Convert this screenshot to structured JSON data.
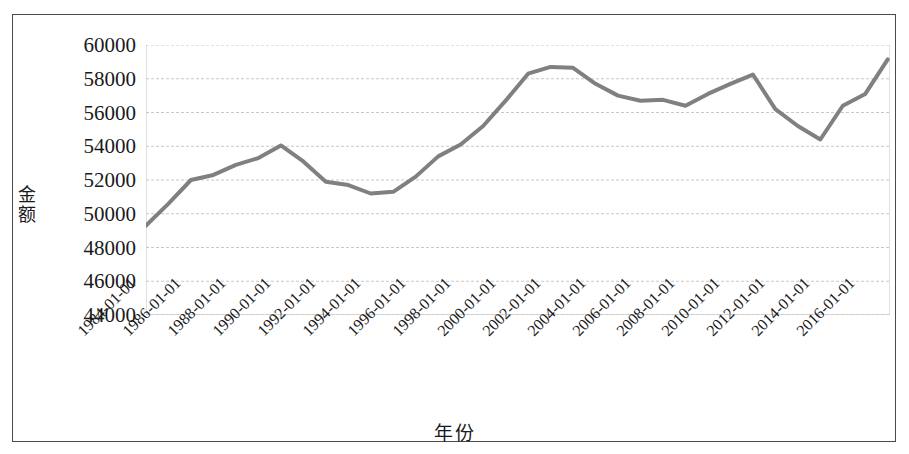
{
  "chart_data": {
    "type": "line",
    "title": "",
    "xlabel": "年份",
    "ylabel": "金额",
    "grid": true,
    "legend": "none",
    "line_color": "#808080",
    "line_width": 4,
    "ylim": [
      44000,
      60000
    ],
    "ytick_step": 2000,
    "yticks": [
      60000,
      58000,
      56000,
      54000,
      52000,
      50000,
      48000,
      46000,
      44000
    ],
    "ytick_labels": [
      "60000",
      "58000",
      "56000",
      "54000",
      "52000",
      "50000",
      "48000",
      "46000",
      "44000"
    ],
    "xticks": [
      "1984-01-01",
      "1986-01-01",
      "1988-01-01",
      "1990-01-01",
      "1992-01-01",
      "1994-01-01",
      "1996-01-01",
      "1998-01-01",
      "2000-01-01",
      "2002-01-01",
      "2004-01-01",
      "2006-01-01",
      "2008-01-01",
      "2010-01-01",
      "2012-01-01",
      "2014-01-01",
      "2016-01-01"
    ],
    "x": [
      "1984",
      "1985",
      "1986",
      "1987",
      "1988",
      "1989",
      "1990",
      "1991",
      "1992",
      "1993",
      "1994",
      "1995",
      "1996",
      "1997",
      "1998",
      "1999",
      "2000",
      "2001",
      "2002",
      "2003",
      "2004",
      "2005",
      "2006",
      "2007",
      "2008",
      "2009",
      "2010",
      "2011",
      "2012",
      "2013",
      "2014",
      "2015",
      "2016",
      "2017"
    ],
    "values": [
      49300,
      50600,
      52000,
      52300,
      52900,
      53300,
      54050,
      53100,
      51900,
      51700,
      51200,
      51300,
      52200,
      53400,
      54100,
      55200,
      56700,
      58300,
      58700,
      58650,
      57700,
      57000,
      56700,
      56750,
      56400,
      57100,
      57700,
      58250,
      56200,
      55700,
      54600,
      53500,
      53400,
      53450
    ],
    "values_tail": [
      55200,
      54400,
      56400,
      57100,
      59150
    ],
    "x_tail": [
      "2013",
      "2014",
      "2015",
      "2016",
      "2017"
    ]
  }
}
